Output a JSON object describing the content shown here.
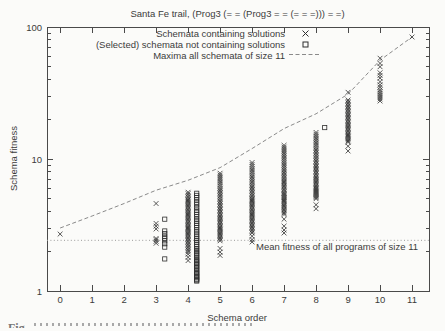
{
  "figure": {
    "caption_start": "Fig.",
    "colors": {
      "axis": "#4a4a4a",
      "text": "#3b3b3b",
      "marker": "#2e2e2e",
      "maxima_line": "#8a8a8a",
      "mean_line": "#9a9a9a"
    }
  },
  "chart_data": {
    "type": "scatter",
    "title": "Santa Fe trail, (Prog3 (= = (Prog3 = = (= = =))) = =)",
    "xlabel": "Schema order",
    "ylabel": "Schema fitness",
    "xlim": [
      -0.41,
      11.53
    ],
    "ylim": [
      1,
      100
    ],
    "y_scale": "log10",
    "grid": false,
    "legend_position": "top-inside-right",
    "x_ticks": [
      0,
      1,
      2,
      3,
      4,
      5,
      6,
      7,
      8,
      9,
      10,
      11
    ],
    "y_ticks": [
      1,
      10,
      100
    ],
    "mean_line": {
      "value": 2.42,
      "label": "Mean fitness of all programs of size 11"
    },
    "series": [
      {
        "name": "Schemata containing solutions",
        "marker": "cross",
        "x_offset": 0,
        "columns": [
          {
            "order": 0,
            "values": [
              2.7
            ]
          },
          {
            "order": 3,
            "values": [
              4.6,
              3.25,
              3.1,
              2.95,
              2.5,
              2.45,
              2.38,
              2.3
            ]
          },
          {
            "order": 4,
            "values": [
              5.6,
              5.45,
              5.3,
              5.15,
              5.0,
              4.9,
              4.8,
              4.7,
              4.6,
              4.5,
              4.4,
              4.3,
              4.2,
              4.1,
              4.0,
              3.92,
              3.84,
              3.76,
              3.68,
              3.6,
              3.52,
              3.44,
              3.36,
              3.28,
              3.2,
              3.13,
              3.06,
              3.0,
              2.94,
              2.88,
              2.82,
              2.76,
              2.7,
              2.64,
              2.58,
              2.52,
              2.46,
              2.4,
              2.34,
              2.28,
              2.22,
              2.16,
              2.1,
              2.04,
              1.98,
              1.9,
              1.8,
              1.7
            ]
          },
          {
            "order": 5,
            "values": [
              7.8,
              7.55,
              7.3,
              7.05,
              6.8,
              6.6,
              6.4,
              6.2,
              6.0,
              5.85,
              5.7,
              5.55,
              5.4,
              5.25,
              5.1,
              4.95,
              4.8,
              4.68,
              4.56,
              4.44,
              4.32,
              4.2,
              4.1,
              4.0,
              3.9,
              3.8,
              3.7,
              3.62,
              3.54,
              3.46,
              3.38,
              3.3,
              3.22,
              3.14,
              3.06,
              3.0,
              2.94,
              2.88,
              2.82,
              2.76,
              2.7,
              2.64,
              2.58,
              2.52,
              2.46,
              2.4,
              2.1,
              1.97,
              1.86
            ]
          },
          {
            "order": 6,
            "values": [
              9.4,
              9.1,
              8.8,
              8.5,
              8.25,
              8.0,
              7.75,
              7.5,
              7.3,
              7.1,
              6.9,
              6.7,
              6.5,
              6.3,
              6.15,
              6.0,
              5.85,
              5.7,
              5.55,
              5.4,
              5.25,
              5.1,
              5.0,
              4.9,
              4.8,
              4.7,
              4.6,
              4.5,
              4.4,
              4.3,
              4.2,
              4.1,
              4.0,
              3.92,
              3.84,
              3.76,
              3.68,
              3.6,
              3.52,
              3.44,
              3.36,
              3.28,
              3.2,
              3.12,
              3.05,
              2.98,
              2.9,
              2.82,
              2.75,
              2.6,
              2.45,
              2.35
            ]
          },
          {
            "order": 7,
            "values": [
              12.7,
              12.3,
              11.9,
              11.5,
              11.1,
              10.8,
              10.5,
              10.2,
              9.9,
              9.6,
              9.3,
              9.0,
              8.75,
              8.5,
              8.25,
              8.0,
              7.8,
              7.6,
              7.4,
              7.2,
              7.0,
              6.85,
              6.7,
              6.55,
              6.4,
              6.25,
              6.1,
              5.95,
              5.8,
              5.65,
              5.5,
              5.4,
              5.3,
              5.2,
              5.1,
              5.0,
              4.9,
              4.8,
              4.7,
              4.6,
              4.5,
              4.4,
              4.3,
              4.2,
              4.1,
              4.0,
              3.9,
              3.8,
              3.5,
              3.1,
              2.9,
              2.75
            ]
          },
          {
            "order": 8,
            "values": [
              15.9,
              15.4,
              14.9,
              14.4,
              14.0,
              13.6,
              13.2,
              12.8,
              12.4,
              12.0,
              11.7,
              11.4,
              11.1,
              10.8,
              10.5,
              10.2,
              9.9,
              9.65,
              9.4,
              9.15,
              8.9,
              8.7,
              8.5,
              8.3,
              8.1,
              7.9,
              7.7,
              7.5,
              7.3,
              7.15,
              7.0,
              6.85,
              6.7,
              6.55,
              6.4,
              6.25,
              6.1,
              6.0,
              5.9,
              5.8,
              5.7,
              5.6,
              5.5,
              5.4,
              5.3,
              5.2,
              5.1,
              5.0,
              4.5,
              4.2
            ]
          },
          {
            "order": 9,
            "values": [
              32,
              28,
              27.3,
              26.6,
              25.9,
              25.2,
              24.6,
              24.0,
              23.4,
              22.8,
              22.2,
              21.7,
              21.2,
              20.7,
              20.2,
              19.7,
              19.2,
              18.7,
              18.3,
              17.9,
              17.5,
              17.1,
              16.7,
              16.3,
              15.9,
              15.5,
              15.2,
              14.9,
              14.6,
              14.3,
              14.0,
              13.7,
              13.4,
              12.5,
              11.5
            ]
          },
          {
            "order": 10,
            "values": [
              58,
              53,
              50,
              45,
              43,
              41,
              38.5,
              36.5,
              35,
              33.5,
              32.5,
              31.5,
              30.5,
              29.5,
              28.5,
              27.5
            ]
          },
          {
            "order": 11,
            "values": [
              84
            ]
          }
        ]
      },
      {
        "name": "(Selected) schemata not containing solutions",
        "marker": "square",
        "x_offset": 0.27,
        "columns": [
          {
            "order": 3,
            "values": [
              3.5,
              2.85,
              2.72,
              2.6,
              2.5,
              2.4,
              2.28,
              2.15,
              1.75
            ]
          },
          {
            "order": 4,
            "values": [
              5.5,
              5.3,
              5.1,
              4.9,
              4.7,
              4.5,
              4.3,
              4.1,
              3.95,
              3.8,
              3.65,
              3.5,
              3.38,
              3.26,
              3.14,
              3.02,
              2.9,
              2.8,
              2.7,
              2.6,
              2.5,
              2.42,
              2.34,
              2.26,
              2.18,
              2.1,
              2.04,
              1.98,
              1.92,
              1.86,
              1.8,
              1.75,
              1.7,
              1.66,
              1.62,
              1.58,
              1.54,
              1.5,
              1.46,
              1.42,
              1.38,
              1.35,
              1.32,
              1.29,
              1.26,
              1.23,
              1.21,
              1.19
            ]
          },
          {
            "order": 8,
            "values": [
              17.3
            ]
          }
        ]
      },
      {
        "name": "Maxima all schemata of size 11",
        "style": "dashed_line",
        "points": [
          [
            0,
            3.0
          ],
          [
            1,
            3.7
          ],
          [
            2,
            4.6
          ],
          [
            3,
            5.8
          ],
          [
            4,
            6.9
          ],
          [
            5,
            8.6
          ],
          [
            6,
            12.0
          ],
          [
            7,
            17.0
          ],
          [
            8,
            22.0
          ],
          [
            9,
            31.0
          ],
          [
            10,
            56.0
          ],
          [
            11,
            84.0
          ]
        ]
      }
    ]
  }
}
